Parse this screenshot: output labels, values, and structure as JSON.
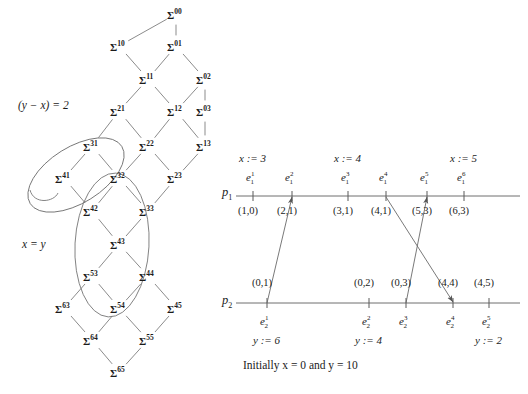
{
  "figure": {
    "title_caption": "Initially x = 0 and y = 10",
    "colors": {
      "ink": "#1b1b1b",
      "line": "#6e6e6e",
      "background": "#ffffff"
    }
  },
  "lattice": {
    "annotations": [
      {
        "id": "cond-y-minus-x",
        "text": "(y − x) = 2",
        "x": 18,
        "y": 100
      },
      {
        "id": "cond-x-equals-y",
        "text": "x = y",
        "x": 22,
        "y": 239
      }
    ],
    "nodes": [
      {
        "id": "s00",
        "label": "Σ",
        "sup": "00",
        "x": 167,
        "y": 8
      },
      {
        "id": "s10",
        "label": "Σ",
        "sup": "10",
        "x": 110,
        "y": 40
      },
      {
        "id": "s01",
        "label": "Σ",
        "sup": "01",
        "x": 167,
        "y": 40
      },
      {
        "id": "s11",
        "label": "Σ",
        "sup": "11",
        "x": 139,
        "y": 73
      },
      {
        "id": "s02",
        "label": "Σ",
        "sup": "02",
        "x": 196,
        "y": 73
      },
      {
        "id": "s21",
        "label": "Σ",
        "sup": "21",
        "x": 110,
        "y": 105
      },
      {
        "id": "s12",
        "label": "Σ",
        "sup": "12",
        "x": 167,
        "y": 105
      },
      {
        "id": "s03",
        "label": "Σ",
        "sup": "03",
        "x": 196,
        "y": 105
      },
      {
        "id": "s31",
        "label": "Σ",
        "sup": "31",
        "x": 83,
        "y": 140
      },
      {
        "id": "s22",
        "label": "Σ",
        "sup": "22",
        "x": 139,
        "y": 140
      },
      {
        "id": "s13",
        "label": "Σ",
        "sup": "13",
        "x": 196,
        "y": 140
      },
      {
        "id": "s41",
        "label": "Σ",
        "sup": "41",
        "x": 55,
        "y": 172
      },
      {
        "id": "s32",
        "label": "Σ",
        "sup": "32",
        "x": 110,
        "y": 172
      },
      {
        "id": "s23",
        "label": "Σ",
        "sup": "23",
        "x": 167,
        "y": 172
      },
      {
        "id": "s42",
        "label": "Σ",
        "sup": "42",
        "x": 83,
        "y": 205
      },
      {
        "id": "s33",
        "label": "Σ",
        "sup": "33",
        "x": 139,
        "y": 205
      },
      {
        "id": "s43",
        "label": "Σ",
        "sup": "43",
        "x": 110,
        "y": 238
      },
      {
        "id": "s53",
        "label": "Σ",
        "sup": "53",
        "x": 83,
        "y": 270
      },
      {
        "id": "s44",
        "label": "Σ",
        "sup": "44",
        "x": 139,
        "y": 270
      },
      {
        "id": "s63",
        "label": "Σ",
        "sup": "63",
        "x": 55,
        "y": 302
      },
      {
        "id": "s54",
        "label": "Σ",
        "sup": "54",
        "x": 110,
        "y": 302
      },
      {
        "id": "s45",
        "label": "Σ",
        "sup": "45",
        "x": 167,
        "y": 302
      },
      {
        "id": "s64",
        "label": "Σ",
        "sup": "64",
        "x": 83,
        "y": 334
      },
      {
        "id": "s55",
        "label": "Σ",
        "sup": "55",
        "x": 139,
        "y": 334
      },
      {
        "id": "s65",
        "label": "Σ",
        "sup": "65",
        "x": 110,
        "y": 366
      }
    ],
    "edges": [
      [
        "s00",
        "s10"
      ],
      [
        "s00",
        "s01"
      ],
      [
        "s10",
        "s11"
      ],
      [
        "s01",
        "s11"
      ],
      [
        "s01",
        "s02"
      ],
      [
        "s11",
        "s21"
      ],
      [
        "s11",
        "s12"
      ],
      [
        "s02",
        "s12"
      ],
      [
        "s02",
        "s03"
      ],
      [
        "s21",
        "s31"
      ],
      [
        "s21",
        "s22"
      ],
      [
        "s12",
        "s22"
      ],
      [
        "s12",
        "s13"
      ],
      [
        "s03",
        "s13"
      ],
      [
        "s31",
        "s41"
      ],
      [
        "s31",
        "s32"
      ],
      [
        "s22",
        "s32"
      ],
      [
        "s22",
        "s23"
      ],
      [
        "s13",
        "s23"
      ],
      [
        "s41",
        "s42"
      ],
      [
        "s32",
        "s42"
      ],
      [
        "s32",
        "s33"
      ],
      [
        "s23",
        "s33"
      ],
      [
        "s42",
        "s43"
      ],
      [
        "s33",
        "s43"
      ],
      [
        "s43",
        "s53"
      ],
      [
        "s43",
        "s44"
      ],
      [
        "s53",
        "s63"
      ],
      [
        "s53",
        "s54"
      ],
      [
        "s44",
        "s54"
      ],
      [
        "s44",
        "s45"
      ],
      [
        "s63",
        "s64"
      ],
      [
        "s54",
        "s64"
      ],
      [
        "s54",
        "s55"
      ],
      [
        "s45",
        "s55"
      ],
      [
        "s64",
        "s65"
      ],
      [
        "s55",
        "s65"
      ]
    ],
    "highlight_regions": [
      {
        "id": "region-y-minus-x-equals-2",
        "shape": "ellipse",
        "cx": 76,
        "cy": 175,
        "rx": 54,
        "ry": 28,
        "rotate": -32
      },
      {
        "id": "region-x-equals-y",
        "shape": "ellipse",
        "cx": 112,
        "cy": 245,
        "rx": 37,
        "ry": 72,
        "rotate": 3
      }
    ]
  },
  "timeline": {
    "processes": [
      {
        "id": "p1",
        "label": "p",
        "sub": "1",
        "label_x": 222,
        "label_y": 186,
        "axis_y": 196,
        "axis_x1": 236,
        "axis_x2": 520,
        "events": [
          {
            "id": "e1_1",
            "base": "e",
            "sup": "1",
            "sub": "1",
            "x": 253,
            "vector": "(1,0)",
            "op": "x := 3"
          },
          {
            "id": "e1_2",
            "base": "e",
            "sup": "2",
            "sub": "1",
            "x": 292,
            "vector": "(2,1)",
            "op": ""
          },
          {
            "id": "e1_3",
            "base": "e",
            "sup": "3",
            "sub": "1",
            "x": 348,
            "vector": "(3,1)",
            "op": "x := 4"
          },
          {
            "id": "e1_4",
            "base": "e",
            "sup": "4",
            "sub": "1",
            "x": 386,
            "vector": "(4,1)",
            "op": ""
          },
          {
            "id": "e1_5",
            "base": "e",
            "sup": "5",
            "sub": "1",
            "x": 427,
            "vector": "(5,3)",
            "op": ""
          },
          {
            "id": "e1_6",
            "base": "e",
            "sup": "6",
            "sub": "1",
            "x": 464,
            "vector": "(6,3)",
            "op": "x := 5"
          }
        ]
      },
      {
        "id": "p2",
        "label": "p",
        "sub": "2",
        "label_x": 222,
        "label_y": 294,
        "axis_y": 303,
        "axis_x1": 236,
        "axis_x2": 520,
        "events": [
          {
            "id": "e2_1",
            "base": "e",
            "sup": "1",
            "sub": "2",
            "x": 267,
            "vector": "(0,1)",
            "op": "y := 6"
          },
          {
            "id": "e2_2",
            "base": "e",
            "sup": "2",
            "sub": "2",
            "x": 369,
            "vector": "(0,2)",
            "op": "y := 4"
          },
          {
            "id": "e2_3",
            "base": "e",
            "sup": "3",
            "sub": "2",
            "x": 406,
            "vector": "(0,3)",
            "op": ""
          },
          {
            "id": "e2_4",
            "base": "e",
            "sup": "4",
            "sub": "2",
            "x": 453,
            "vector": "(4,4)",
            "op": ""
          },
          {
            "id": "e2_5",
            "base": "e",
            "sup": "5",
            "sub": "2",
            "x": 489,
            "vector": "(4,5)",
            "op": "y := 2"
          }
        ]
      }
    ],
    "messages": [
      {
        "id": "msg-e2_1-to-e1_2",
        "from": "e2_1",
        "to": "e1_2",
        "x1": 267,
        "y1": 303,
        "x2": 292,
        "y2": 197
      },
      {
        "id": "msg-e1_4-to-e2_4",
        "from": "e1_4",
        "to": "e2_4",
        "x1": 386,
        "y1": 197,
        "x2": 453,
        "y2": 302
      },
      {
        "id": "msg-e2_3-to-e1_5",
        "from": "e2_3",
        "to": "e1_5",
        "x1": 406,
        "y1": 303,
        "x2": 427,
        "y2": 197
      }
    ],
    "caption": {
      "text": "Initially x = 0 and y = 10",
      "x": 243,
      "y": 360
    }
  }
}
